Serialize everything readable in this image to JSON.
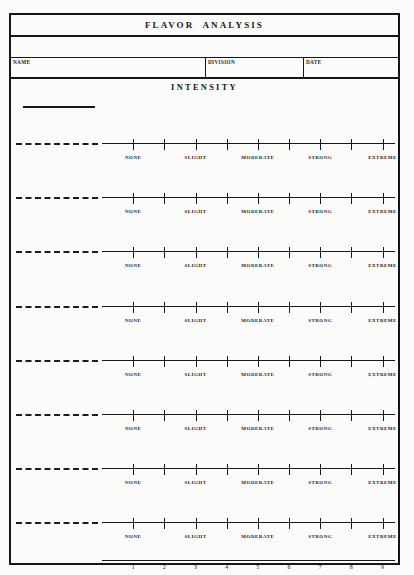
{
  "form": {
    "title": "FLAVOR  ANALYSIS",
    "intensity_heading": "INTENSITY",
    "fields": [
      {
        "label": "NAME",
        "value": ""
      },
      {
        "label": "DIVISION",
        "value": ""
      },
      {
        "label": "DATE",
        "value": ""
      }
    ],
    "scale": {
      "tick_count": 9,
      "labels": [
        "NONE",
        "SLIGHT",
        "MODERATE",
        "STRONG",
        "EXTREME"
      ],
      "label_tick_positions": [
        1,
        3,
        5,
        7,
        9
      ]
    },
    "attribute_rows": [
      {
        "attribute": "",
        "rating": null
      },
      {
        "attribute": "",
        "rating": null
      },
      {
        "attribute": "",
        "rating": null
      },
      {
        "attribute": "",
        "rating": null
      },
      {
        "attribute": "",
        "rating": null
      },
      {
        "attribute": "",
        "rating": null
      },
      {
        "attribute": "",
        "rating": null
      },
      {
        "attribute": "",
        "rating": null
      }
    ],
    "number_axis": {
      "labels": [
        "1",
        "2",
        "3",
        "4",
        "5",
        "6",
        "7",
        "8",
        "9"
      ]
    },
    "colors": {
      "ink": "#17181c",
      "paper": "#fbfbfa"
    }
  }
}
